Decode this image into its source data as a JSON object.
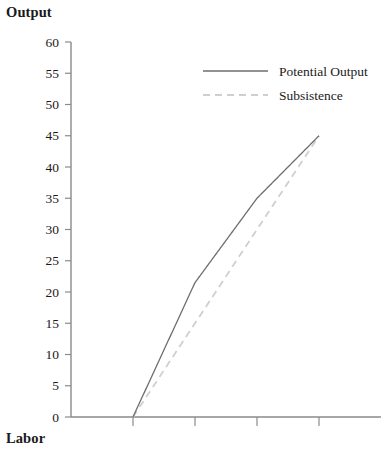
{
  "chart_data": {
    "type": "line",
    "title": "",
    "xlabel": "Labor",
    "ylabel": "Output",
    "ylim": [
      0,
      60
    ],
    "ytick_values": [
      0,
      5,
      10,
      15,
      20,
      25,
      30,
      35,
      40,
      45,
      50,
      55,
      60
    ],
    "ytick_labels": [
      "0",
      "5",
      "10",
      "15",
      "20",
      "25",
      "30",
      "35",
      "40",
      "45",
      "50",
      "55",
      "60"
    ],
    "xtick_labels": [
      "",
      "",
      "",
      ""
    ],
    "xtick_positions": [
      1,
      2,
      3,
      4
    ],
    "xlim": [
      0,
      5
    ],
    "grid": false,
    "legend_position": "top-right",
    "series": [
      {
        "name": "Potential Output",
        "style": "solid",
        "color": "#6e6e6e",
        "x": [
          1,
          2,
          3,
          4
        ],
        "values": [
          0,
          21.5,
          35,
          45
        ]
      },
      {
        "name": "Subsistence",
        "style": "dashed",
        "color": "#cfcfcf",
        "x": [
          1,
          4
        ],
        "values": [
          0,
          45
        ]
      }
    ]
  },
  "axes": {
    "y_title": "Output",
    "x_title": "Labor"
  },
  "legend": {
    "entries": [
      {
        "label": "Potential Output",
        "style": "solid"
      },
      {
        "label": "Subsistence",
        "style": "dashed"
      }
    ]
  },
  "colors": {
    "axis": "#8a8a8a",
    "potential_output": "#6e6e6e",
    "subsistence": "#cfcfcf",
    "text": "#1a1a1a"
  }
}
